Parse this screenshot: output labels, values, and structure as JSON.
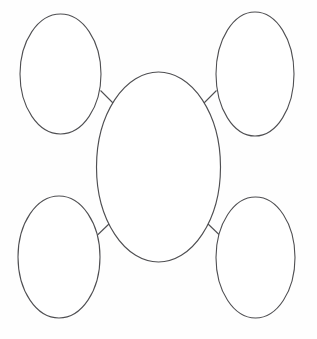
{
  "document": {
    "title": "Concept Map Graphic Organizer",
    "background_color": "#fefefe",
    "stroke_color": "#4f4f52",
    "fill_color": "#ffffff",
    "width": 317,
    "height": 339
  },
  "diagram": {
    "type": "concept-map",
    "layout": "central-node-with-four-satellites",
    "center_node": {
      "id": "center",
      "label": "",
      "shape": "ellipse",
      "cx": 158.5,
      "cy": 167,
      "rx": 62,
      "ry": 95
    },
    "satellite_nodes": [
      {
        "id": "top-left",
        "label": "",
        "shape": "ellipse",
        "cx": 60.5,
        "cy": 74,
        "rx": 40.5,
        "ry": 60
      },
      {
        "id": "top-right",
        "label": "",
        "shape": "ellipse",
        "cx": 255,
        "cy": 74,
        "rx": 39,
        "ry": 62
      },
      {
        "id": "bottom-left",
        "label": "",
        "shape": "ellipse",
        "cx": 59,
        "cy": 257,
        "rx": 41,
        "ry": 61
      },
      {
        "id": "bottom-right",
        "label": "",
        "shape": "ellipse",
        "cx": 255.5,
        "cy": 257.5,
        "rx": 39.5,
        "ry": 60.5
      }
    ],
    "connectors": [
      {
        "id": "connector-top-left",
        "from": "top-left",
        "to": "center",
        "x1": 100.5,
        "y1": 90.5,
        "x2": 113.5,
        "y2": 103.5
      },
      {
        "id": "connector-top-right",
        "from": "top-right",
        "to": "center",
        "x1": 216.5,
        "y1": 90.5,
        "x2": 203.5,
        "y2": 103.5
      },
      {
        "id": "connector-bottom-left",
        "from": "bottom-left",
        "to": "center",
        "x1": 97.5,
        "y1": 235.0,
        "x2": 110.5,
        "y2": 222.5
      },
      {
        "id": "connector-bottom-right",
        "from": "bottom-right",
        "to": "center",
        "x1": 219.5,
        "y1": 235.0,
        "x2": 206.5,
        "y2": 222.5
      }
    ]
  }
}
